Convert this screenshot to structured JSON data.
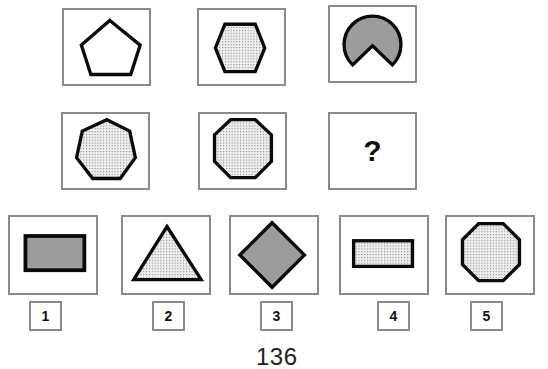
{
  "puzzle": {
    "grid": [
      {
        "shape": "pentagon",
        "sides": 5,
        "fill": "white"
      },
      {
        "shape": "hexagon",
        "sides": 6,
        "fill": "dotted"
      },
      {
        "shape": "circle-with-notch",
        "fill": "gray"
      },
      {
        "shape": "heptagon",
        "sides": 7,
        "fill": "dotted"
      },
      {
        "shape": "octagon",
        "sides": 8,
        "fill": "dotted"
      },
      {
        "shape": "missing",
        "symbol": "?"
      }
    ],
    "options": [
      {
        "label": "1",
        "shape": "rectangle",
        "fill": "gray"
      },
      {
        "label": "2",
        "shape": "triangle",
        "fill": "dotted"
      },
      {
        "label": "3",
        "shape": "diamond",
        "fill": "gray"
      },
      {
        "label": "4",
        "shape": "thin-rectangle",
        "fill": "dotted"
      },
      {
        "label": "5",
        "shape": "octagon",
        "fill": "dotted"
      }
    ]
  },
  "question_mark": "?",
  "page_number": "136",
  "colors": {
    "stroke": "#0a0a0a",
    "gray_fill": "#9c9c9c",
    "dotted_bg": "#f2f2f2",
    "dot": "#8c8c8c",
    "frame": "#8a8a8a"
  }
}
